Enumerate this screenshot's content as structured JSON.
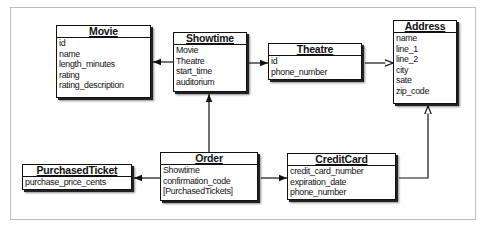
{
  "diagram": {
    "type": "entity-relationship",
    "entities": {
      "movie": {
        "name": "Movie",
        "fields": [
          "id",
          "name",
          "length_minutes",
          "rating",
          "rating_description"
        ]
      },
      "showtime": {
        "name": "Showtime",
        "fields": [
          "Movie",
          "Theatre",
          "start_time",
          "auditorium"
        ]
      },
      "theatre": {
        "name": "Theatre",
        "fields": [
          "id",
          "phone_number"
        ]
      },
      "address": {
        "name": "Address",
        "fields": [
          "name",
          "line_1",
          "line_2",
          "city",
          "sate",
          "zip_code"
        ]
      },
      "purchased_ticket": {
        "name": "PurchasedTicket",
        "fields": [
          "purchase_price_cents"
        ]
      },
      "order": {
        "name": "Order",
        "fields": [
          "Showtime",
          "confirmation_code",
          "[PurchasedTickets]"
        ]
      },
      "credit_card": {
        "name": "CreditCard",
        "fields": [
          "credit_card_number",
          "expiration_date",
          "phone_number"
        ]
      }
    },
    "relationships": [
      {
        "from": "Showtime",
        "to": "Movie",
        "arrow": "filled"
      },
      {
        "from": "Showtime",
        "to": "Theatre",
        "arrow": "filled"
      },
      {
        "from": "Theatre",
        "to": "Address",
        "arrow": "hollow"
      },
      {
        "from": "Order",
        "to": "Showtime",
        "arrow": "filled"
      },
      {
        "from": "Order",
        "to": "PurchasedTicket",
        "arrow": "filled"
      },
      {
        "from": "Order",
        "to": "CreditCard",
        "arrow": "filled"
      },
      {
        "from": "CreditCard",
        "to": "Address",
        "arrow": "hollow"
      }
    ],
    "colors": {
      "line": "#111111",
      "frame": "#bdbdbd",
      "background": "#ffffff"
    }
  }
}
